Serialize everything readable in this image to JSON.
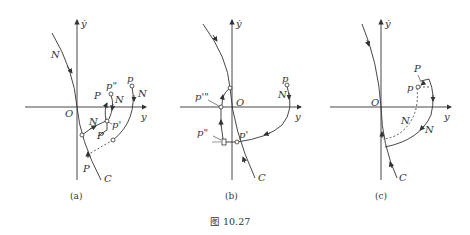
{
  "figure": {
    "caption": "图 10.27",
    "panels": [
      {
        "id": "a",
        "caption": "(a)",
        "axis_labels": {
          "vertical": "ẏ",
          "horizontal": "y",
          "origin": "O"
        },
        "curve_label": "C",
        "labels": {
          "N_upper": "N",
          "N_mid": "N",
          "N_right": "N",
          "N_inner": "N",
          "P_lower": "P",
          "P_mid": "P",
          "P_inner": "P",
          "p": "p",
          "p_prime": "p'",
          "p_double": "p\""
        }
      },
      {
        "id": "b",
        "caption": "(b)",
        "axis_labels": {
          "vertical": "ẏ",
          "horizontal": "y",
          "origin": "O"
        },
        "curve_label": "C",
        "labels": {
          "p": "p",
          "N": "N",
          "p_prime": "p'",
          "p_double": "p\"",
          "p_triple": "p'\""
        }
      },
      {
        "id": "c",
        "caption": "(c)",
        "axis_labels": {
          "vertical": "ẏ",
          "horizontal": "y",
          "origin": "O"
        },
        "curve_label": "C",
        "labels": {
          "P": "P",
          "p": "p",
          "N_inner": "N",
          "N_outer": "N"
        }
      }
    ]
  },
  "colors": {
    "stroke": "#333333",
    "background": "#ffffff"
  }
}
